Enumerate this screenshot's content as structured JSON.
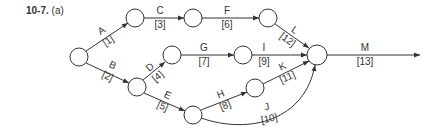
{
  "figure": {
    "number": "10-7.",
    "part": "(a)"
  },
  "nodes": [
    {
      "id": "n1",
      "x": 79,
      "y": 57,
      "r": 9
    },
    {
      "id": "n2",
      "x": 135,
      "y": 18,
      "r": 9
    },
    {
      "id": "n3",
      "x": 193,
      "y": 18,
      "r": 9
    },
    {
      "id": "n4",
      "x": 268,
      "y": 18,
      "r": 9
    },
    {
      "id": "n5",
      "x": 172,
      "y": 55,
      "r": 9
    },
    {
      "id": "n6",
      "x": 243,
      "y": 55,
      "r": 9
    },
    {
      "id": "n7",
      "x": 317,
      "y": 55,
      "r": 10
    },
    {
      "id": "n8",
      "x": 137,
      "y": 87,
      "r": 9
    },
    {
      "id": "n9",
      "x": 193,
      "y": 115,
      "r": 9
    },
    {
      "id": "n10",
      "x": 255,
      "y": 88,
      "r": 9
    }
  ],
  "activities": [
    {
      "label": "A",
      "duration": "[1]"
    },
    {
      "label": "B",
      "duration": "[2]"
    },
    {
      "label": "C",
      "duration": "[3]"
    },
    {
      "label": "D",
      "duration": "[4]"
    },
    {
      "label": "E",
      "duration": "[5]"
    },
    {
      "label": "F",
      "duration": "[6]"
    },
    {
      "label": "G",
      "duration": "[7]"
    },
    {
      "label": "H",
      "duration": "[8]"
    },
    {
      "label": "I",
      "duration": "[9]"
    },
    {
      "label": "J",
      "duration": "[10]"
    },
    {
      "label": "K",
      "duration": "[11]"
    },
    {
      "label": "L",
      "duration": "[12]"
    },
    {
      "label": "M",
      "duration": "[13]"
    }
  ],
  "colors": {
    "stroke": "#333333",
    "background": "#ffffff"
  }
}
